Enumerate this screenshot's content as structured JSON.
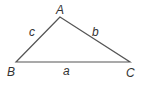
{
  "diagram": {
    "type": "triangle",
    "stroke_color": "#555555",
    "vertices": [
      {
        "label": "A",
        "x": 60,
        "y": 17
      },
      {
        "label": "B",
        "x": 16,
        "y": 62
      },
      {
        "label": "C",
        "x": 130,
        "y": 62
      }
    ],
    "sides": [
      {
        "label": "a",
        "between": "B-C"
      },
      {
        "label": "b",
        "between": "A-C"
      },
      {
        "label": "c",
        "between": "A-B"
      }
    ]
  },
  "labels": {
    "A": "A",
    "B": "B",
    "C": "C",
    "a": "a",
    "b": "b",
    "c": "c"
  }
}
